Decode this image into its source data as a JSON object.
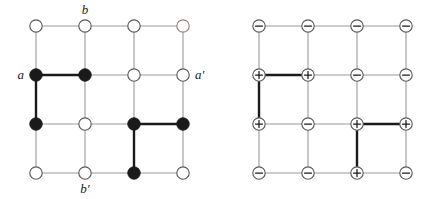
{
  "figure": {
    "title": "",
    "panels": [
      {
        "id": "left-lattice",
        "kind": "occupancy-lattice",
        "rows": 4,
        "cols": 4,
        "node_states": [
          [
            "open",
            "open",
            "open",
            "open"
          ],
          [
            "filled",
            "filled",
            "open",
            "open"
          ],
          [
            "filled",
            "open",
            "filled",
            "filled"
          ],
          [
            "open",
            "open",
            "filled",
            "open"
          ]
        ],
        "bold_edges": [
          {
            "from": [
              1,
              0
            ],
            "to": [
              1,
              1
            ],
            "orientation": "horizontal"
          },
          {
            "from": [
              1,
              0
            ],
            "to": [
              2,
              0
            ],
            "orientation": "vertical"
          },
          {
            "from": [
              2,
              2
            ],
            "to": [
              2,
              3
            ],
            "orientation": "horizontal"
          },
          {
            "from": [
              2,
              2
            ],
            "to": [
              3,
              2
            ],
            "orientation": "vertical"
          }
        ],
        "labels": [
          {
            "text": "b",
            "anchor_node": [
              0,
              1
            ],
            "position": "above"
          },
          {
            "text": "a",
            "anchor_node": [
              1,
              0
            ],
            "position": "left"
          },
          {
            "text": "a′",
            "anchor_node": [
              1,
              3
            ],
            "position": "right"
          },
          {
            "text": "b′",
            "anchor_node": [
              3,
              1
            ],
            "position": "below"
          }
        ]
      },
      {
        "id": "right-lattice",
        "kind": "charge-lattice",
        "rows": 4,
        "cols": 4,
        "node_states": [
          [
            "minus",
            "minus",
            "minus",
            "minus"
          ],
          [
            "plus",
            "plus",
            "minus",
            "minus"
          ],
          [
            "plus",
            "minus",
            "plus",
            "plus"
          ],
          [
            "minus",
            "minus",
            "plus",
            "minus"
          ]
        ],
        "bold_edges": [
          {
            "from": [
              1,
              0
            ],
            "to": [
              1,
              1
            ],
            "orientation": "horizontal"
          },
          {
            "from": [
              1,
              0
            ],
            "to": [
              2,
              0
            ],
            "orientation": "vertical"
          },
          {
            "from": [
              2,
              2
            ],
            "to": [
              2,
              3
            ],
            "orientation": "horizontal"
          },
          {
            "from": [
              2,
              2
            ],
            "to": [
              3,
              2
            ],
            "orientation": "vertical"
          }
        ],
        "labels": []
      }
    ],
    "colors": {
      "grid_line": "#9a9a9a",
      "bold_line": "#1a1a1a",
      "node_fill_filled": "#1a1a1a",
      "node_fill_open": "#ffffff",
      "node_stroke": "#5a5a5a",
      "node_stroke_tinted": "#9b7f7f",
      "label_text": "#1a1a1a",
      "background": "#ffffff"
    },
    "glyphs": {
      "plus": "+",
      "minus": "−"
    }
  }
}
